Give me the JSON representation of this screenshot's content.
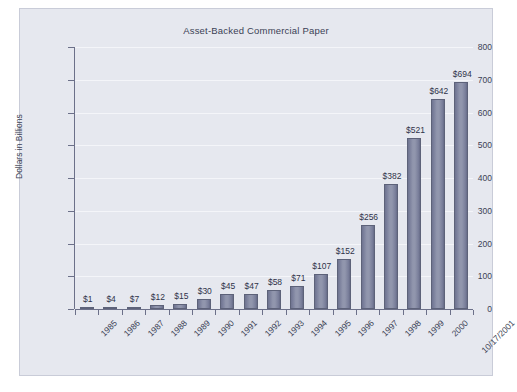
{
  "chart_data": {
    "type": "bar",
    "title": "Asset-Backed Commercial Paper",
    "xlabel": "",
    "ylabel": "Dollars in Billions",
    "ylim": [
      0,
      800
    ],
    "yticks": [
      0,
      100,
      200,
      300,
      400,
      500,
      600,
      700,
      800
    ],
    "ytick_labels": [
      "0",
      "100",
      "200",
      "300",
      "400",
      "500",
      "600",
      "700",
      "800"
    ],
    "grid": true,
    "legend": false,
    "categories": [
      "1985",
      "1986",
      "1987",
      "1988",
      "1989",
      "1990",
      "1991",
      "1992",
      "1993",
      "1994",
      "1995",
      "1996",
      "1997",
      "1998",
      "1999",
      "2000",
      "10/17/2001"
    ],
    "values": [
      1,
      4,
      7,
      12,
      15,
      30,
      45,
      47,
      58,
      71,
      107,
      152,
      256,
      382,
      521,
      642,
      694
    ],
    "data_labels": [
      "$1",
      "$4",
      "$7",
      "$12",
      "$15",
      "$30",
      "$45",
      "$47",
      "$58",
      "$71",
      "$107",
      "$152",
      "$256",
      "$382",
      "$521",
      "$642",
      "$694"
    ],
    "colors": {
      "panel_background": "#e6e8ef",
      "panel_border": "#c9ccd8",
      "bar_fill": "#9196ad",
      "bar_edge": "#5d6279",
      "gridline": "#f4f5f9",
      "axis": "#6c7089",
      "text": "#3b3f55"
    }
  }
}
